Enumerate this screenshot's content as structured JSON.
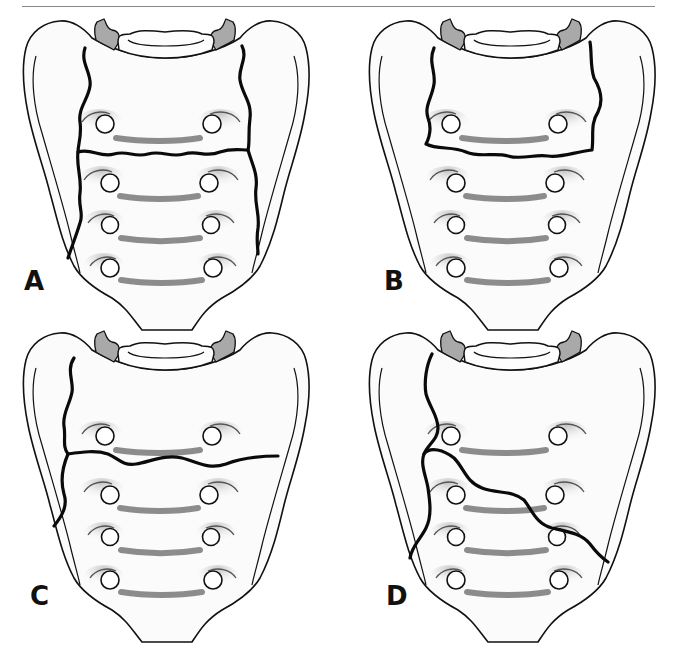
{
  "figure": {
    "type": "anatomical-diagram",
    "panels": [
      {
        "id": "A",
        "label": "A",
        "fracture_description": "bilateral vertical fractures joined by a transverse fracture (H-type)"
      },
      {
        "id": "B",
        "label": "B",
        "fracture_description": "bilateral vertical fractures joined by a transverse fracture below S1 foramina (U-type)"
      },
      {
        "id": "C",
        "label": "C",
        "fracture_description": "unilateral vertical fracture with transverse fracture extending across (lambda-type)"
      },
      {
        "id": "D",
        "label": "D",
        "fracture_description": "unilateral vertical fracture with oblique transverse fracture (T/oblique-type)"
      }
    ],
    "colors": {
      "outline": "#111111",
      "fracture_line": "#0a0a0a",
      "facet_fill": "#a9a9a9",
      "bone_fill": "#fbfbfb",
      "foramen_bar": "#8c8c8c"
    }
  }
}
